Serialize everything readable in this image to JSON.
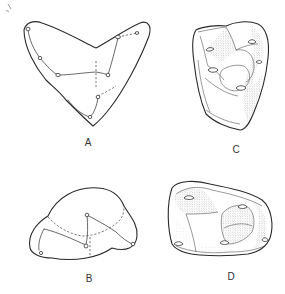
{
  "figure": {
    "panels": [
      {
        "id": "A",
        "label": "A",
        "style": "outline-diagram"
      },
      {
        "id": "B",
        "label": "B",
        "style": "outline-diagram"
      },
      {
        "id": "C",
        "label": "C",
        "style": "stippled-drawing"
      },
      {
        "id": "D",
        "label": "D",
        "style": "stippled-drawing"
      }
    ],
    "colors": {
      "background": "#ffffff",
      "ink": "#2a2a2a"
    }
  }
}
